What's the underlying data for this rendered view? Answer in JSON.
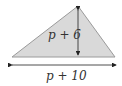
{
  "diagram": {
    "shape": "triangle",
    "fill_color": "#d9d9d9",
    "stroke_color": "#9a9a9a",
    "arrow_color": "#222222",
    "height_label": "p + 6",
    "base_label": "p + 10"
  }
}
